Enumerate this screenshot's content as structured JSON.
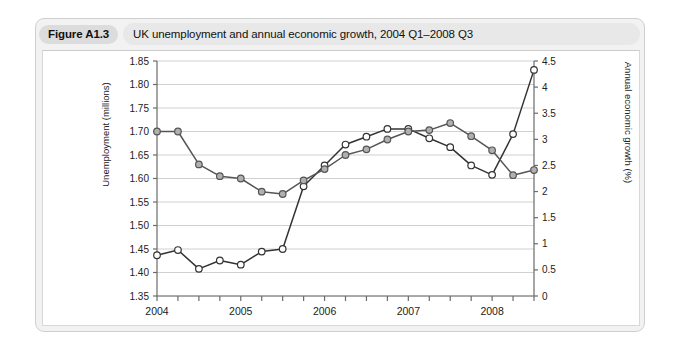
{
  "figure": {
    "badge": "Figure A1.3",
    "caption": "UK unemployment and annual economic growth, 2004 Q1–2008 Q3"
  },
  "colors": {
    "card_background": "#f2f2f2",
    "card_border": "#cfcfcf",
    "badge_background": "#dcdcdc",
    "caption_background": "#e8e8e8",
    "plot_background": "#ffffff",
    "gridline": "#d0d0d0",
    "axis": "#6b6b6b",
    "unemployment_line": "#555555",
    "unemployment_marker_fill": "#b0b0b0",
    "growth_line": "#333333",
    "growth_marker_fill": "#ffffff"
  },
  "chart_data": {
    "type": "line",
    "title": "UK unemployment and annual economic growth, 2004 Q1–2008 Q3",
    "xlabel": "",
    "grid": true,
    "legend": "none",
    "x": [
      "2004 Q1",
      "2004 Q2",
      "2004 Q3",
      "2004 Q4",
      "2005 Q1",
      "2005 Q2",
      "2005 Q3",
      "2005 Q4",
      "2006 Q1",
      "2006 Q2",
      "2006 Q3",
      "2006 Q4",
      "2007 Q1",
      "2007 Q2",
      "2007 Q3",
      "2007 Q4",
      "2008 Q1",
      "2008 Q2",
      "2008 Q3"
    ],
    "x_tick_labels": [
      "2004",
      "2005",
      "2006",
      "2007",
      "2008"
    ],
    "x_tick_positions": [
      "2004 Q1",
      "2005 Q1",
      "2006 Q1",
      "2007 Q1",
      "2008 Q1"
    ],
    "series": [
      {
        "name": "Unemployment (millions)",
        "axis": "left",
        "ylabel": "Unemployment (millions)",
        "ylim": [
          1.35,
          1.85
        ],
        "ytick_labels": [
          "1.35",
          "1.40",
          "1.45",
          "1.50",
          "1.55",
          "1.60",
          "1.65",
          "1.70",
          "1.75",
          "1.80",
          "1.85"
        ],
        "marker": "circle-filled-grey",
        "values": [
          1.7,
          1.7,
          1.63,
          1.605,
          1.6,
          1.572,
          1.567,
          1.596,
          1.62,
          1.65,
          1.662,
          1.683,
          1.7,
          1.703,
          1.718,
          1.69,
          1.66,
          1.607,
          1.618
        ]
      },
      {
        "name": "Annual economic growth (%)",
        "axis": "right",
        "ylabel": "Annual economic growth (%)",
        "ylim": [
          0,
          4.5
        ],
        "ytick_labels": [
          "0",
          "0.5",
          "1",
          "1.5",
          "2",
          "2.5",
          "3",
          "3.5",
          "4",
          "4.5"
        ],
        "marker": "circle-open",
        "values": [
          0.78,
          0.88,
          0.52,
          0.68,
          0.6,
          0.85,
          0.9,
          2.1,
          2.5,
          2.9,
          3.05,
          3.2,
          3.2,
          3.02,
          2.85,
          2.5,
          2.32,
          3.1,
          4.33
        ]
      }
    ],
    "note": "Left axis = unemployment in millions (1.35-1.85). Right axis = annual economic growth in percent (0-4.5). Growth series values are plotted against the right axis; the steep rise in the unemployment curve at the end of the sample reaches 1.83 on the left scale while growth falls to 0.3%."
  },
  "axes": {
    "left": {
      "title": "Unemployment (millions)",
      "ticks": [
        "1.85",
        "1.80",
        "1.75",
        "1.70",
        "1.65",
        "1.60",
        "1.55",
        "1.50",
        "1.45",
        "1.40",
        "1.35"
      ]
    },
    "right": {
      "title": "Annual economic growth (%)",
      "ticks": [
        "4.5",
        "4",
        "3.5",
        "3",
        "2.5",
        "2",
        "1.5",
        "1",
        "0.5",
        "0"
      ]
    },
    "bottom": {
      "ticks": [
        "2004",
        "2005",
        "2006",
        "2007",
        "2008"
      ]
    }
  }
}
